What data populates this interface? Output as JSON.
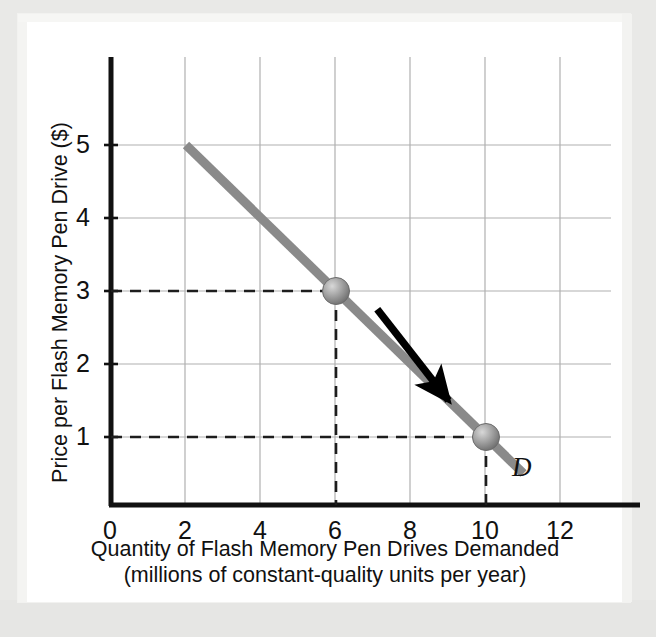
{
  "chart_data": {
    "type": "line",
    "title": "",
    "subtitle": "",
    "xlabel_line1": "Quantity of Flash Memory Pen Drives Demanded",
    "xlabel_line2": "(millions of constant-quality units per year)",
    "ylabel": "Price per Flash Memory Pen Drive ($)",
    "xlim": [
      0,
      13.4
    ],
    "ylim": [
      0,
      5.8
    ],
    "xticks": [
      0,
      2,
      4,
      6,
      8,
      10,
      12
    ],
    "xticklabels": [
      "0",
      "2",
      "4",
      "6",
      "8",
      "10",
      "12"
    ],
    "yticks": [
      1,
      2,
      3,
      4,
      5
    ],
    "yticklabels": [
      "1",
      "2",
      "3",
      "4",
      "5"
    ],
    "grid": true,
    "grid_color": "#b0b0b0",
    "legend": "none",
    "series": [
      {
        "name": "D",
        "label": "D",
        "kind": "demand-curve",
        "color": "#8a8a8a",
        "linewidth": 7,
        "x": [
          2,
          11
        ],
        "y": [
          5,
          0.5
        ]
      }
    ],
    "points": [
      {
        "name": "point-a",
        "x": 6,
        "y": 3,
        "marker": "sphere",
        "color": "#9a9a9a"
      },
      {
        "name": "point-b",
        "x": 10,
        "y": 1,
        "marker": "sphere",
        "color": "#9a9a9a"
      }
    ],
    "guide_lines": [
      {
        "orientation": "horizontal",
        "value": 3,
        "from_x": 0,
        "to_x": 6,
        "style": "dashed",
        "color": "#222222"
      },
      {
        "orientation": "vertical",
        "value": 6,
        "from_y": 0,
        "to_y": 3,
        "style": "dashed",
        "color": "#222222"
      },
      {
        "orientation": "horizontal",
        "value": 1,
        "from_x": 0,
        "to_x": 10,
        "style": "dashed",
        "color": "#222222"
      },
      {
        "orientation": "vertical",
        "value": 10,
        "from_y": 0,
        "to_y": 1,
        "style": "dashed",
        "color": "#222222"
      }
    ],
    "annotations": [
      {
        "name": "movement-arrow",
        "type": "arrow",
        "text": "",
        "from": [
          7.1,
          2.75
        ],
        "to": [
          9.0,
          1.5
        ],
        "color": "#000000",
        "description": "arrow indicating movement down along the demand curve"
      },
      {
        "name": "curve-label-d",
        "type": "text",
        "text": "D",
        "at": [
          11.3,
          0.35
        ],
        "style": "italic",
        "color": "#111111"
      }
    ]
  },
  "axis": {
    "axis_color": "#111111",
    "background": "#ffffff",
    "page_background": "#e9e9e7"
  }
}
